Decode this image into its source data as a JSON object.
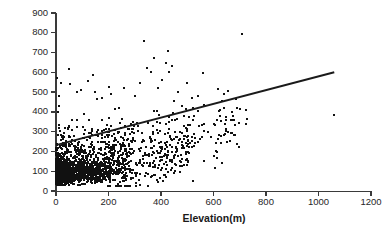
{
  "chart_data": {
    "type": "scatter",
    "title": "",
    "xlabel": "Elevation(m)",
    "ylabel": "Precipitation (mm)",
    "xlim": [
      0,
      1200
    ],
    "ylim": [
      0,
      900
    ],
    "xticks": [
      0,
      200,
      400,
      600,
      800,
      1000,
      1200
    ],
    "yticks": [
      0,
      100,
      200,
      300,
      400,
      500,
      600,
      700,
      800,
      900
    ],
    "grid": false,
    "legend": null,
    "marker": {
      "shape": "square",
      "color": "#111111",
      "size_px": 2
    },
    "series": [
      {
        "name": "Stations",
        "type": "scatter",
        "n_points_approx": 1800,
        "description": "Dense cloud of weather-station observations; concentrated at low elevation (0-200 m) and low precipitation (20-250 mm), spreading upward and rightward with a weak positive association.",
        "notable_points": [
          [
            5,
            570
          ],
          [
            10,
            480
          ],
          [
            12,
            430
          ],
          [
            20,
            545
          ],
          [
            50,
            617
          ],
          [
            55,
            540
          ],
          [
            80,
            500
          ],
          [
            95,
            510
          ],
          [
            120,
            555
          ],
          [
            140,
            585
          ],
          [
            150,
            500
          ],
          [
            175,
            470
          ],
          [
            200,
            525
          ],
          [
            210,
            490
          ],
          [
            240,
            420
          ],
          [
            260,
            520
          ],
          [
            300,
            480
          ],
          [
            320,
            545
          ],
          [
            335,
            758
          ],
          [
            345,
            620
          ],
          [
            360,
            600
          ],
          [
            375,
            670
          ],
          [
            390,
            520
          ],
          [
            405,
            560
          ],
          [
            420,
            645
          ],
          [
            428,
            710
          ],
          [
            432,
            600
          ],
          [
            440,
            630
          ],
          [
            450,
            455
          ],
          [
            465,
            500
          ],
          [
            480,
            430
          ],
          [
            500,
            545
          ],
          [
            520,
            50
          ],
          [
            540,
            480
          ],
          [
            560,
            595
          ],
          [
            565,
            305
          ],
          [
            580,
            300
          ],
          [
            600,
            340
          ],
          [
            610,
            245
          ],
          [
            640,
            490
          ],
          [
            648,
            360
          ],
          [
            655,
            505
          ],
          [
            668,
            295
          ],
          [
            690,
            420
          ],
          [
            700,
            415
          ],
          [
            710,
            795
          ],
          [
            1060,
            385
          ]
        ]
      },
      {
        "name": "Linear trend",
        "type": "line",
        "color": "#1a1a1a",
        "width_px": 2,
        "endpoints": [
          [
            0,
            232
          ],
          [
            1060,
            600
          ]
        ],
        "slope_per_m": 0.347,
        "intercept_mm": 232
      }
    ]
  },
  "axes": {
    "y_title": "Precipitation (mm)",
    "x_title": "Elevation(m)",
    "y_tick_labels": [
      "0",
      "100",
      "200",
      "300",
      "400",
      "500",
      "600",
      "700",
      "800",
      "900"
    ],
    "x_tick_labels": [
      "0",
      "200",
      "400",
      "600",
      "800",
      "1000",
      "1200"
    ]
  },
  "colors": {
    "axis": "#3a3a3a",
    "point": "#111111",
    "trend": "#1a1a1a",
    "text": "#262626",
    "background": "#ffffff"
  }
}
